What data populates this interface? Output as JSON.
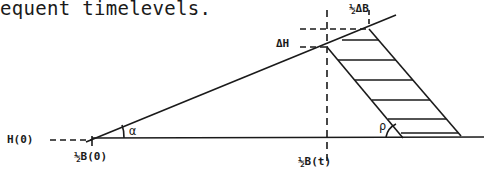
{
  "caption": "equent timelevels.",
  "labels": {
    "half_delta_b": "½ΔB",
    "delta_h": "ΔH",
    "h0": "H(0)",
    "alpha": "α",
    "half_b0": "½B(0)",
    "half_bt": "½B(t)",
    "rho": "ρ"
  },
  "colors": {
    "ink": "#1a1a1a",
    "background": "#ffffff"
  }
}
